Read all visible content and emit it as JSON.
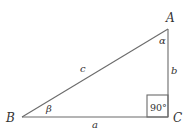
{
  "diagram": {
    "type": "right-triangle",
    "stroke_color": "#6b6b6b",
    "text_color": "#333333",
    "vertices": {
      "A": {
        "label": "A"
      },
      "B": {
        "label": "B"
      },
      "C": {
        "label": "C"
      }
    },
    "sides": {
      "a": {
        "label": "a",
        "between": "B-C"
      },
      "b": {
        "label": "b",
        "between": "A-C"
      },
      "c": {
        "label": "c",
        "between": "A-B"
      }
    },
    "angles": {
      "alpha": {
        "label": "α",
        "at": "A"
      },
      "beta": {
        "label": "β",
        "at": "B"
      },
      "right": {
        "label": "90°",
        "at": "C"
      }
    }
  }
}
